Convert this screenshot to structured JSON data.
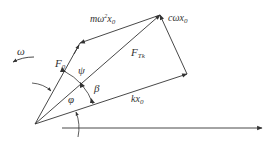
{
  "diagram": {
    "type": "phasor force vector diagram",
    "colors": {
      "line": "#333333",
      "background": "#ffffff"
    },
    "vectors": [
      {
        "id": "F0",
        "label_main": "F",
        "label_sub": "0",
        "from": [
          35,
          124
        ],
        "to": [
          80,
          43
        ]
      },
      {
        "id": "FTk",
        "label_main": "F",
        "label_sub": "Tk",
        "from": [
          35,
          124
        ],
        "to": [
          160,
          15
        ]
      },
      {
        "id": "kx0",
        "label_main": "kx",
        "label_sub": "0",
        "from": [
          35,
          124
        ],
        "to": [
          187,
          74
        ]
      },
      {
        "id": "cwx0",
        "label_main": "cωx",
        "label_sub": "0",
        "from": [
          187,
          74
        ],
        "to": [
          160,
          15
        ]
      },
      {
        "id": "mw2x0",
        "label_main": "mω",
        "label_sup": "2",
        "label_main2": "x",
        "label_sub": "0",
        "from": [
          160,
          15
        ],
        "to": [
          80,
          43
        ]
      }
    ],
    "angles": [
      {
        "id": "psi",
        "label": "ψ"
      },
      {
        "id": "beta",
        "label": "β"
      },
      {
        "id": "phi",
        "label": "φ"
      }
    ],
    "rotation": {
      "label": "ω"
    },
    "axis": {
      "from": [
        62,
        128
      ],
      "to": [
        262,
        128
      ]
    }
  },
  "labels": {
    "F0_main": "F",
    "F0_sub": "0",
    "FTk_main": "F",
    "FTk_sub": "Tk",
    "kx0_main": "kx",
    "kx0_sub": "0",
    "cwx0_main": "cωx",
    "cwx0_sub": "0",
    "mw2x0_m": "mω",
    "mw2x0_sup": "2",
    "mw2x0_x": "x",
    "mw2x0_sub": "0",
    "psi": "ψ",
    "beta": "β",
    "phi": "φ",
    "omega": "ω"
  }
}
